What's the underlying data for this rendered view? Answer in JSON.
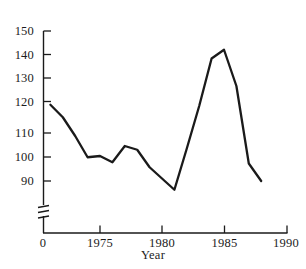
{
  "chart_data": {
    "type": "line",
    "title": "",
    "subtitle": "",
    "xlabel": "Year",
    "ylabel": "",
    "grid": false,
    "legend": null,
    "xlim": [
      1970.0,
      1990.0
    ],
    "ylim": [
      86.0,
      150.0
    ],
    "yaxis_break": true,
    "yaxis_break_note": "axis broken between 0 and ~86",
    "xticks": [
      0,
      1975,
      1980,
      1985,
      1990
    ],
    "xtick_labels": [
      "0",
      "1975",
      "1980",
      "1985",
      "1990"
    ],
    "yticks": [
      90,
      100,
      110,
      120,
      130,
      140,
      150
    ],
    "ytick_labels": [
      "90",
      "100",
      "110",
      "120",
      "130",
      "140",
      "150"
    ],
    "x": [
      1971,
      1972,
      1973,
      1974,
      1975,
      1976,
      1977,
      1978,
      1979,
      1980,
      1981,
      1982,
      1983,
      1984,
      1985,
      1986,
      1987,
      1988
    ],
    "values": [
      120.5,
      115.5,
      108.0,
      99.5,
      100.0,
      97.5,
      104.0,
      102.5,
      95.5,
      91.0,
      86.5,
      103.0,
      120.0,
      139.0,
      142.5,
      128.0,
      97.0,
      90.0
    ],
    "series": [
      {
        "name": "series-1",
        "color": "#1a1a1a",
        "values": [
          120.5,
          115.5,
          108.0,
          99.5,
          100.0,
          97.5,
          104.0,
          102.5,
          95.5,
          91.0,
          86.5,
          103.0,
          120.0,
          139.0,
          142.5,
          128.0,
          97.0,
          90.0
        ]
      }
    ],
    "annotations": []
  },
  "axes": {
    "x_title": "Year"
  }
}
